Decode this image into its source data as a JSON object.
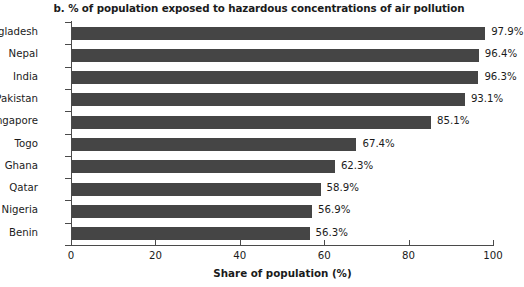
{
  "chart_data": {
    "type": "bar",
    "orientation": "horizontal",
    "title": "b. % of population exposed to hazardous concentrations of air pollution",
    "xlabel": "Share of population (%)",
    "ylabel": "",
    "xlim": [
      0,
      100
    ],
    "xticks": [
      "0",
      "20",
      "40",
      "60",
      "80",
      "100"
    ],
    "xtick_values": [
      0,
      20,
      40,
      60,
      80,
      100
    ],
    "grid": false,
    "legend": false,
    "bar_color": "#454545",
    "categories": [
      "Bangladesh",
      "Nepal",
      "India",
      "Pakistan",
      "Singapore",
      "Togo",
      "Ghana",
      "Qatar",
      "Nigeria",
      "Benin"
    ],
    "values": [
      97.9,
      96.4,
      96.3,
      93.1,
      85.1,
      67.4,
      62.3,
      58.9,
      56.9,
      56.3
    ],
    "value_labels": [
      "97.9%",
      "96.4%",
      "96.3%",
      "93.1%",
      "85.1%",
      "67.4%",
      "62.3%",
      "58.9%",
      "56.9%",
      "56.3%"
    ]
  }
}
